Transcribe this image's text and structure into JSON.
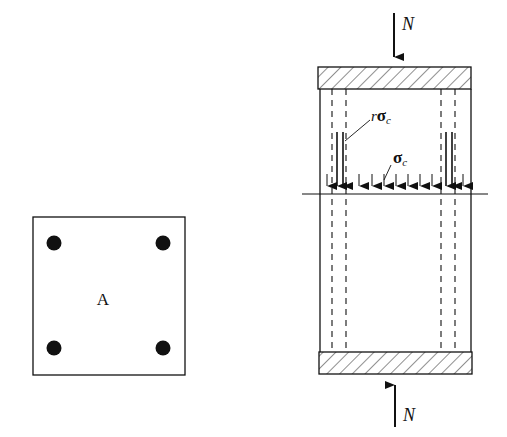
{
  "cross_section": {
    "center_label": "A",
    "bar_count": 4
  },
  "column": {
    "top_load_label": "N",
    "bottom_load_label": "N",
    "steel_stress_label_prefix": "r",
    "steel_stress_label_symbol": "σ",
    "steel_stress_label_sub": "c",
    "concrete_stress_label_symbol": "σ",
    "concrete_stress_label_sub": "c"
  },
  "colors": {
    "ink": "#111111",
    "background": "#ffffff"
  }
}
